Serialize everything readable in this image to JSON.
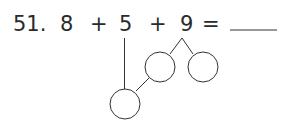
{
  "problem": {
    "number": "51.",
    "terms": [
      "8",
      "+",
      "5",
      "+",
      "9",
      "="
    ],
    "answer": ""
  },
  "diagram": {
    "decompose_term": "9",
    "make_ten_target": "5",
    "circles": [
      "",
      "",
      ""
    ]
  }
}
